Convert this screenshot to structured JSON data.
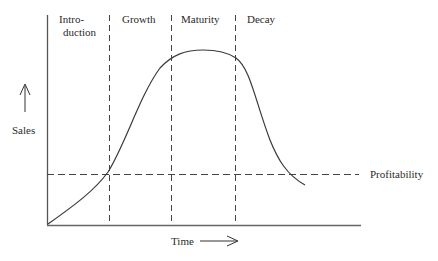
{
  "diagram": {
    "stages": [
      {
        "label_line1": "Intro-",
        "label_line2": "duction"
      },
      {
        "label_line1": "Growth"
      },
      {
        "label_line1": "Maturity"
      },
      {
        "label_line1": "Decay"
      }
    ],
    "y_axis_label": "Sales",
    "x_axis_label": "Time",
    "threshold_label": "Profitability",
    "colors": {
      "line": "#3a3a3a",
      "axis": "#555555",
      "text": "#2a2a2a",
      "background": "#ffffff"
    }
  }
}
